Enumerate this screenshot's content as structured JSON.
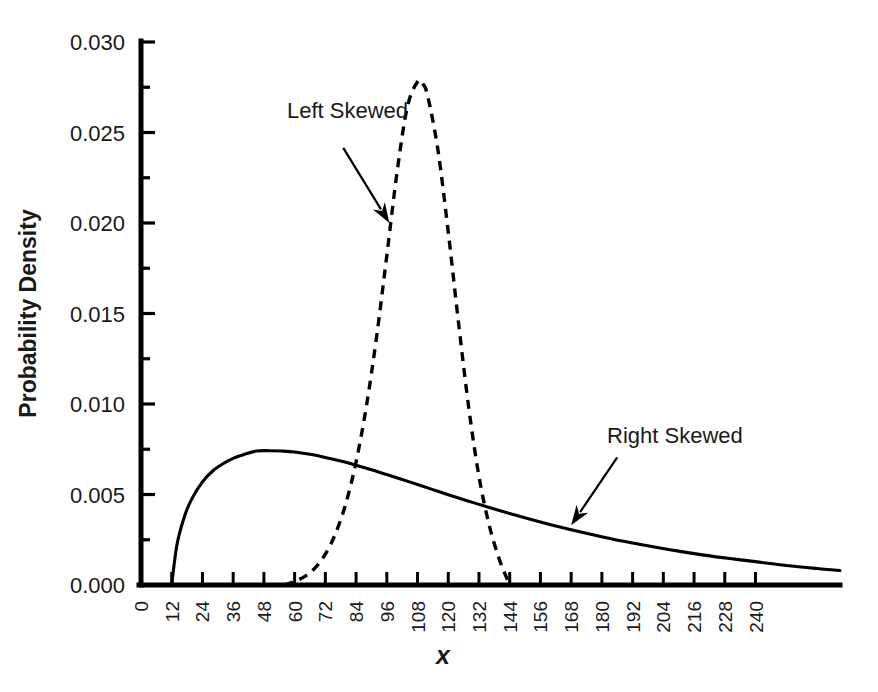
{
  "chart_data": {
    "type": "line",
    "title": "",
    "xlabel": "x",
    "ylabel": "Probability Density",
    "xlim": [
      0,
      273
    ],
    "ylim": [
      0.0,
      0.03
    ],
    "grid": false,
    "legend_position": "none",
    "x_ticks": [
      0,
      12,
      24,
      36,
      48,
      60,
      72,
      84,
      96,
      108,
      120,
      132,
      144,
      156,
      168,
      180,
      192,
      204,
      216,
      228,
      240
    ],
    "x_tick_labels": [
      "0",
      "12",
      "24",
      "36",
      "48",
      "60",
      "72",
      "84",
      "96",
      "108",
      "120",
      "132",
      "144",
      "156",
      "168",
      "180",
      "192",
      "204",
      "216",
      "228",
      "240"
    ],
    "y_ticks": [
      0.0,
      0.005,
      0.01,
      0.015,
      0.02,
      0.025,
      0.03
    ],
    "y_tick_labels": [
      "0.000",
      "0.005",
      "0.010",
      "0.015",
      "0.020",
      "0.025",
      "0.030"
    ],
    "y_minor_ticks": [
      0.0025,
      0.0075,
      0.0125,
      0.0175,
      0.0225,
      0.0275
    ],
    "series": [
      {
        "name": "Right Skewed",
        "style": "solid",
        "color": "#000000",
        "x": [
          12,
          14,
          17,
          20,
          24,
          28,
          32,
          36,
          40,
          45,
          50,
          55,
          60,
          66,
          72,
          78,
          84,
          90,
          96,
          102,
          108,
          114,
          120,
          128,
          136,
          144,
          152,
          160,
          168,
          176,
          184,
          192,
          200,
          210,
          220,
          230,
          240,
          252,
          264,
          273
        ],
        "y": [
          0.0,
          0.0022,
          0.0038,
          0.0048,
          0.0057,
          0.0063,
          0.0067,
          0.007,
          0.0072,
          0.0074,
          0.00742,
          0.0074,
          0.00735,
          0.00722,
          0.00705,
          0.00685,
          0.00662,
          0.00637,
          0.0061,
          0.00583,
          0.00555,
          0.00527,
          0.00499,
          0.00463,
          0.00428,
          0.00395,
          0.00363,
          0.00333,
          0.00305,
          0.00279,
          0.00254,
          0.00232,
          0.00211,
          0.00187,
          0.00165,
          0.00146,
          0.00129,
          0.00108,
          0.00091,
          0.0008
        ]
      },
      {
        "name": "Left Skewed",
        "style": "dashed",
        "color": "#000000",
        "x": [
          56,
          60,
          64,
          68,
          72,
          76,
          80,
          84,
          88,
          92,
          96,
          100,
          104,
          108,
          110,
          112,
          116,
          120,
          124,
          128,
          132,
          136,
          140,
          144
        ],
        "y": [
          0.0,
          0.0002,
          0.00048,
          0.00095,
          0.0017,
          0.00285,
          0.0045,
          0.0068,
          0.00985,
          0.0137,
          0.0182,
          0.0228,
          0.0264,
          0.0278,
          0.0277,
          0.027,
          0.024,
          0.0195,
          0.0145,
          0.0098,
          0.006,
          0.0033,
          0.0014,
          0.0
        ]
      }
    ],
    "annotations": [
      {
        "label": "Left Skewed",
        "text_x": 57,
        "text_y": 0.0258,
        "arrow_from_x": 79,
        "arrow_from_y": 0.02415,
        "arrow_to_x": 97,
        "arrow_to_y": 0.02
      },
      {
        "label": "Right Skewed",
        "text_x": 182,
        "text_y": 0.00785,
        "arrow_from_x": 186,
        "arrow_from_y": 0.00705,
        "arrow_to_x": 168,
        "arrow_to_y": 0.0033
      }
    ]
  }
}
